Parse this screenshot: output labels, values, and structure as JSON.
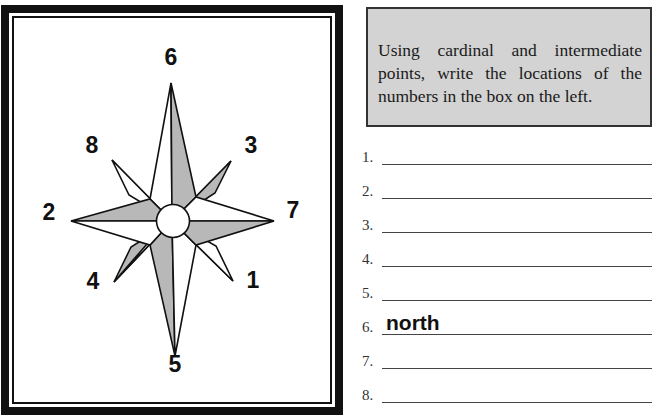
{
  "worksheet": {
    "compass": {
      "labels": [
        {
          "id": "6",
          "text": "6",
          "direction": "N"
        },
        {
          "id": "3",
          "text": "3",
          "direction": "NE"
        },
        {
          "id": "7",
          "text": "7",
          "direction": "E"
        },
        {
          "id": "1",
          "text": "1",
          "direction": "SE"
        },
        {
          "id": "5",
          "text": "5",
          "direction": "S"
        },
        {
          "id": "4",
          "text": "4",
          "direction": "SW"
        },
        {
          "id": "2",
          "text": "2",
          "direction": "W"
        },
        {
          "id": "8",
          "text": "8",
          "direction": "NW"
        }
      ],
      "colors": {
        "shade": "#b8b8b8",
        "outline": "#111111",
        "fill": "#ffffff"
      }
    },
    "instructions": {
      "text": "Using cardinal and intermediate points, write the locations of the numbers in the box on the left.",
      "background": "#d3d3d3"
    },
    "answers": [
      {
        "number": "1.",
        "value": ""
      },
      {
        "number": "2.",
        "value": ""
      },
      {
        "number": "3.",
        "value": ""
      },
      {
        "number": "4.",
        "value": ""
      },
      {
        "number": "5.",
        "value": ""
      },
      {
        "number": "6.",
        "value": "north"
      },
      {
        "number": "7.",
        "value": ""
      },
      {
        "number": "8.",
        "value": ""
      }
    ]
  }
}
